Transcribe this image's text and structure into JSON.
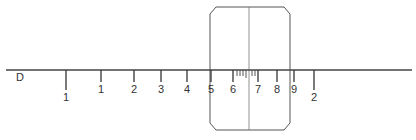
{
  "diagram": {
    "line_label": "D",
    "ticks": [
      {
        "x": 66,
        "label": "1",
        "long": true
      },
      {
        "x": 101,
        "label": "1",
        "long": false
      },
      {
        "x": 134,
        "label": "2",
        "long": false
      },
      {
        "x": 161,
        "label": "3",
        "long": false
      },
      {
        "x": 187,
        "label": "4",
        "long": false
      },
      {
        "x": 211,
        "label": "5",
        "long": false
      },
      {
        "x": 233,
        "label": "6",
        "long": false
      },
      {
        "x": 258,
        "label": "7",
        "long": false
      },
      {
        "x": 277,
        "label": "8",
        "long": false
      },
      {
        "x": 294,
        "label": "9",
        "long": false
      },
      {
        "x": 314,
        "label": "2",
        "long": true
      }
    ],
    "minor_ticks_x": [
      237,
      240,
      243,
      246,
      249,
      252,
      255
    ],
    "window": {
      "x": 210,
      "y": 7,
      "width": 80,
      "height": 123,
      "center_line_x": 249
    }
  },
  "labels": {
    "d": "D",
    "t0": "1",
    "t1": "1",
    "t2": "2",
    "t3": "3",
    "t4": "4",
    "t5": "5",
    "t6": "6",
    "t7": "7",
    "t8": "8",
    "t9": "9",
    "t10": "2"
  }
}
